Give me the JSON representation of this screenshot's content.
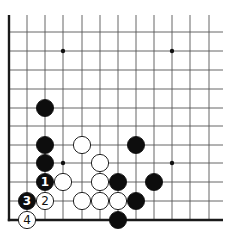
{
  "diagram": {
    "type": "go-board-corner",
    "corner": "bottom-left",
    "columns_x": [
      9,
      27,
      45,
      63,
      82,
      100,
      118,
      136,
      154,
      172,
      190,
      209
    ],
    "rows_y": [
      32,
      51,
      70,
      89,
      108,
      126,
      145,
      163,
      182,
      201,
      220
    ],
    "grid_top": 15,
    "grid_right": 223,
    "stone_radius": 8.6,
    "colors": {
      "black": "#0d0d0d",
      "white": "#ffffff",
      "line": "#555555",
      "edge": "#1a1a1a"
    },
    "star_points": [
      {
        "col": 3,
        "row": 1
      },
      {
        "col": 9,
        "row": 1
      },
      {
        "col": 3,
        "row": 7
      },
      {
        "col": 9,
        "row": 7
      }
    ],
    "stones": [
      {
        "color": "black",
        "col": 2,
        "row": 4,
        "label": ""
      },
      {
        "color": "black",
        "col": 2,
        "row": 6,
        "label": ""
      },
      {
        "color": "black",
        "col": 2,
        "row": 7,
        "label": ""
      },
      {
        "color": "white",
        "col": 4,
        "row": 6,
        "label": ""
      },
      {
        "color": "white",
        "col": 5,
        "row": 7,
        "label": ""
      },
      {
        "color": "black",
        "col": 7,
        "row": 6,
        "label": ""
      },
      {
        "color": "black",
        "col": 2,
        "row": 8,
        "label": "1"
      },
      {
        "color": "white",
        "col": 3,
        "row": 8,
        "label": ""
      },
      {
        "color": "white",
        "col": 5,
        "row": 8,
        "label": ""
      },
      {
        "color": "black",
        "col": 6,
        "row": 8,
        "label": ""
      },
      {
        "color": "black",
        "col": 8,
        "row": 8,
        "label": ""
      },
      {
        "color": "black",
        "col": 1,
        "row": 9,
        "label": "3"
      },
      {
        "color": "white",
        "col": 2,
        "row": 9,
        "label": "2"
      },
      {
        "color": "white",
        "col": 4,
        "row": 9,
        "label": ""
      },
      {
        "color": "white",
        "col": 5,
        "row": 9,
        "label": ""
      },
      {
        "color": "white",
        "col": 6,
        "row": 9,
        "label": ""
      },
      {
        "color": "black",
        "col": 7,
        "row": 9,
        "label": ""
      },
      {
        "color": "white",
        "col": 1,
        "row": 10,
        "label": "4"
      },
      {
        "color": "black",
        "col": 6,
        "row": 10,
        "label": ""
      }
    ]
  }
}
